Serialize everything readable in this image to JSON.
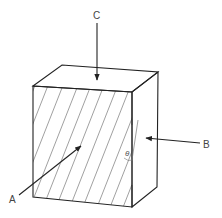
{
  "diagram": {
    "type": "cube-with-grain-and-force-directions",
    "labels": {
      "a": "A",
      "b": "B",
      "c": "C",
      "angle": "θ"
    },
    "colors": {
      "stroke": "#222222",
      "hatch": "#666666",
      "background": "#ffffff"
    }
  }
}
